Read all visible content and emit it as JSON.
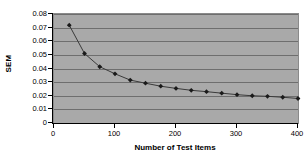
{
  "chart_data": {
    "type": "line",
    "title": "",
    "xlabel": "Number of Test Items",
    "ylabel": "SEM",
    "xlim": [
      0,
      400
    ],
    "ylim": [
      0,
      0.08
    ],
    "grid": "horizontal",
    "legend": "none",
    "marker": "diamond",
    "marker_color": "#1a1a1a",
    "line_color": "#3a3a3a",
    "plot_background": "#a9a9a9",
    "gridline_color": "#6e6e6e",
    "x_ticks": [
      0,
      100,
      200,
      300,
      400
    ],
    "x_tick_labels": [
      "0",
      "100",
      "200",
      "300",
      "400"
    ],
    "y_ticks": [
      0,
      0.01,
      0.02,
      0.03,
      0.04,
      0.05,
      0.06,
      0.07,
      0.08
    ],
    "y_tick_labels": [
      "0",
      "0.01",
      "0.02",
      "0.03",
      "0.04",
      "0.05",
      "0.06",
      "0.07",
      "0.08"
    ],
    "x": [
      25,
      50,
      75,
      100,
      125,
      150,
      175,
      200,
      225,
      250,
      275,
      300,
      325,
      350,
      375,
      400
    ],
    "values": [
      0.0718,
      0.051,
      0.0413,
      0.0361,
      0.0315,
      0.0292,
      0.027,
      0.0254,
      0.024,
      0.023,
      0.0219,
      0.0208,
      0.02,
      0.0196,
      0.0189,
      0.018
    ],
    "series": [
      {
        "name": "SEM",
        "values": [
          0.0718,
          0.051,
          0.0413,
          0.0361,
          0.0315,
          0.0292,
          0.027,
          0.0254,
          0.024,
          0.023,
          0.0219,
          0.0208,
          0.02,
          0.0196,
          0.0189,
          0.018
        ]
      }
    ]
  }
}
